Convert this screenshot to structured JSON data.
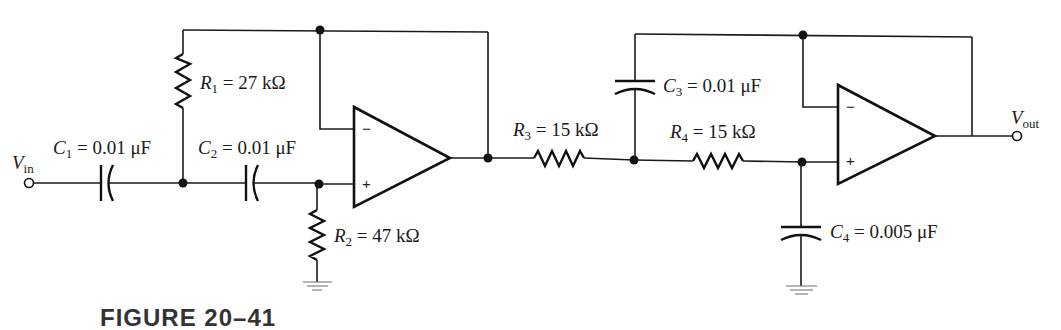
{
  "figure": {
    "caption": "FIGURE 20–41"
  },
  "terminals": {
    "input": {
      "symbol": "V",
      "subscript": "in"
    },
    "output": {
      "symbol": "V",
      "subscript": "out"
    }
  },
  "components": {
    "C1": {
      "symbol": "C",
      "index": "1",
      "value": " = 0.01 μF"
    },
    "C2": {
      "symbol": "C",
      "index": "2",
      "value": " = 0.01 μF"
    },
    "R1": {
      "symbol": "R",
      "index": "1",
      "value": " = 27 kΩ"
    },
    "R2": {
      "symbol": "R",
      "index": "2",
      "value": " = 47 kΩ"
    },
    "R3": {
      "symbol": "R",
      "index": "3",
      "value": " = 15 kΩ"
    },
    "R4": {
      "symbol": "R",
      "index": "4",
      "value": " = 15 kΩ"
    },
    "C3": {
      "symbol": "C",
      "index": "3",
      "value": " = 0.01 μF"
    },
    "C4": {
      "symbol": "C",
      "index": "4",
      "value": " = 0.005 μF"
    }
  },
  "opamps": {
    "U1": {
      "inverting": "−",
      "noninverting": "+"
    },
    "U2": {
      "inverting": "−",
      "noninverting": "+"
    }
  }
}
